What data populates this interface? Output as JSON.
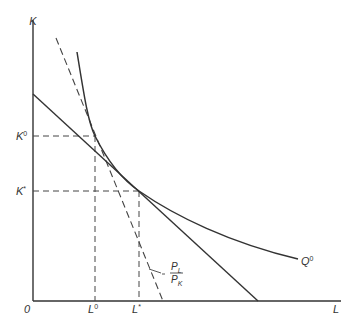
{
  "diagram": {
    "type": "isoquant-isocost",
    "axes": {
      "y_label": "K",
      "x_label": "L",
      "origin_label": "0"
    },
    "y_ticks": [
      {
        "main": "K",
        "sup": "0",
        "y": 136
      },
      {
        "main": "K",
        "sup": "*",
        "y": 191
      }
    ],
    "x_ticks": [
      {
        "main": "L",
        "sup": "0",
        "x": 95
      },
      {
        "main": "L",
        "sup": "*",
        "x": 139
      }
    ],
    "isoquant_label": {
      "main": "Q",
      "sup": "0"
    },
    "slope_label": {
      "numerator": "P",
      "numerator_sub": "L",
      "denominator": "P",
      "denominator_sub": "K",
      "prefix": "−"
    },
    "colors": {
      "line": "#333333",
      "background": "#ffffff"
    }
  }
}
